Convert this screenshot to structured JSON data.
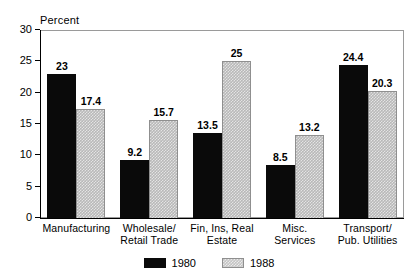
{
  "chart_data": {
    "type": "bar",
    "title": "",
    "subtitle": "",
    "xlabel": "",
    "ylabel": "Percent",
    "ylim": [
      0,
      30
    ],
    "yticks": [
      0,
      5,
      10,
      15,
      20,
      25,
      30
    ],
    "ytick_labels": [
      "0",
      "5",
      "10",
      "15",
      "20",
      "25",
      "30"
    ],
    "grid": false,
    "legend_position": "bottom-center",
    "categories": [
      "Manufacturing",
      "Wholesale/\nRetail Trade",
      "Fin, Ins, Real\nEstate",
      "Misc.\nServices",
      "Transport/\nPub. Utilities"
    ],
    "series": [
      {
        "name": "1980",
        "color": "#0a0a0a",
        "values": [
          23,
          9.2,
          13.5,
          8.5,
          24.4
        ],
        "value_labels": [
          "23",
          "9.2",
          "13.5",
          "8.5",
          "24.4"
        ]
      },
      {
        "name": "1988",
        "color": "#b8b8b8",
        "values": [
          17.4,
          15.7,
          25,
          13.2,
          20.3
        ],
        "value_labels": [
          "17.4",
          "15.7",
          "25",
          "13.2",
          "20.3"
        ]
      }
    ]
  },
  "legend": {
    "items": [
      {
        "label": "1980",
        "swatch": "s1980"
      },
      {
        "label": "1988",
        "swatch": "s1988"
      }
    ]
  }
}
